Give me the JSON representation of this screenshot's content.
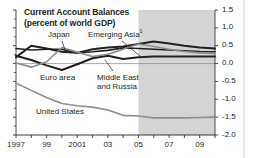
{
  "chart_data": {
    "type": "line",
    "title": "Current Account Balances",
    "subtitle": "(percent of world GDP)",
    "xlabel": "",
    "ylabel": "",
    "ylim": [
      -2.0,
      1.5
    ],
    "xlim": [
      1997,
      2010
    ],
    "grid": false,
    "legend": "inline-annotations",
    "yticks": [
      "1.5",
      "1.0",
      "0.5",
      "0.0",
      "-0.5",
      "-1.0",
      "-1.5",
      "-2.0"
    ],
    "ytick_values": [
      1.5,
      1.0,
      0.5,
      0.0,
      -0.5,
      -1.0,
      -1.5,
      -2.0
    ],
    "xticks": [
      "1997",
      "99",
      "2001",
      "03",
      "05",
      "07",
      "09"
    ],
    "xtick_values": [
      1997,
      1999,
      2001,
      2003,
      2005,
      2007,
      2009
    ],
    "x": [
      1997,
      1998,
      1999,
      2000,
      2001,
      2002,
      2003,
      2004,
      2005,
      2006,
      2007,
      2008,
      2009,
      2010
    ],
    "shaded_region": {
      "from": 2005,
      "to": 2010,
      "color": "#d4d4d4",
      "meaning": "projection"
    },
    "zero_line": 0.0,
    "series": [
      {
        "name": "Japan",
        "label": "Japan",
        "color": "#231f20",
        "width": 1.6,
        "values": [
          0.42,
          0.38,
          0.4,
          0.4,
          0.3,
          0.33,
          0.37,
          0.44,
          0.42,
          0.4,
          0.38,
          0.36,
          0.34,
          0.33
        ]
      },
      {
        "name": "Emerging Asia",
        "label": "Emerging Asia",
        "footnote_marker": "1",
        "color": "#231f20",
        "width": 2.0,
        "values": [
          0.18,
          0.5,
          0.42,
          0.33,
          0.3,
          0.4,
          0.45,
          0.48,
          0.55,
          0.62,
          0.56,
          0.5,
          0.45,
          0.42
        ]
      },
      {
        "name": "Euro area",
        "label": "Euro area",
        "color": "#231f20",
        "width": 2.0,
        "values": [
          0.22,
          0.1,
          -0.05,
          -0.18,
          -0.02,
          0.15,
          0.22,
          0.13,
          0.18,
          0.2,
          0.2,
          0.2,
          0.2,
          0.2
        ]
      },
      {
        "name": "Middle East and Russia",
        "label": "Middle East\nand Russia",
        "label_line1": "Middle East",
        "label_line2": "and Russia",
        "color": "#8d8d8d",
        "width": 1.6,
        "values": [
          0.02,
          -0.1,
          0.05,
          0.45,
          0.32,
          0.2,
          0.26,
          0.4,
          0.55,
          0.48,
          0.4,
          0.34,
          0.3,
          0.28
        ]
      },
      {
        "name": "United States",
        "label": "United States",
        "color": "#8d8d8d",
        "width": 1.6,
        "values": [
          -0.55,
          -0.75,
          -0.95,
          -1.12,
          -1.18,
          -1.22,
          -1.3,
          -1.45,
          -1.47,
          -1.52,
          -1.52,
          -1.52,
          -1.51,
          -1.5
        ]
      }
    ]
  },
  "footnote": {
    "marker": "1"
  }
}
